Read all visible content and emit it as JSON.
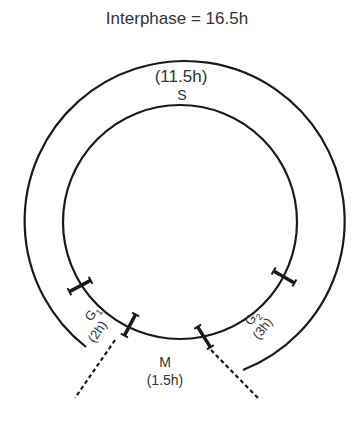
{
  "title": "Interphase = 16.5h",
  "phases": {
    "S": {
      "label": "S",
      "duration": "(11.5h)"
    },
    "G1": {
      "label": "G",
      "subscript": "1",
      "duration": "(2h)"
    },
    "G2": {
      "label": "G",
      "subscript": "2",
      "duration": "(3h)"
    },
    "M": {
      "label": "M",
      "duration": "(1.5h)"
    }
  },
  "colors": {
    "line": "#1a1a1a",
    "text": "#333333",
    "background": "#ffffff"
  }
}
